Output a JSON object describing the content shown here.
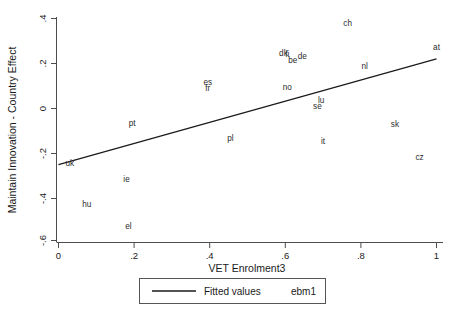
{
  "chart_data": {
    "type": "scatter",
    "title": "",
    "xlabel": "VET Enrolment3",
    "ylabel": "Maintain Innovation - Country Effect",
    "xlim": [
      0,
      1.03
    ],
    "ylim": [
      -0.62,
      0.44
    ],
    "xticks": [
      "0",
      ".2",
      ".4",
      ".6",
      ".8",
      "1"
    ],
    "xtick_values": [
      0,
      0.2,
      0.4,
      0.6,
      0.8,
      1
    ],
    "yticks": [
      ".4",
      ".2",
      "0",
      "-.2",
      "-.4",
      "-.6"
    ],
    "ytick_values": [
      0.4,
      0.2,
      0,
      -0.2,
      -0.4,
      -0.6
    ],
    "grid": false,
    "legend_position": "below-center",
    "marker_style": "text-label-only",
    "points": [
      {
        "label": "uk",
        "x": 0.03,
        "y": -0.25
      },
      {
        "label": "hu",
        "x": 0.075,
        "y": -0.435
      },
      {
        "label": "el",
        "x": 0.185,
        "y": -0.535
      },
      {
        "label": "ie",
        "x": 0.18,
        "y": -0.325
      },
      {
        "label": "pt",
        "x": 0.195,
        "y": -0.07
      },
      {
        "label": "es",
        "x": 0.395,
        "y": 0.115
      },
      {
        "label": "fr",
        "x": 0.395,
        "y": 0.085
      },
      {
        "label": "pl",
        "x": 0.455,
        "y": -0.14
      },
      {
        "label": "dk",
        "x": 0.595,
        "y": 0.245
      },
      {
        "label": "fi",
        "x": 0.605,
        "y": 0.24
      },
      {
        "label": "be",
        "x": 0.62,
        "y": 0.215
      },
      {
        "label": "de",
        "x": 0.645,
        "y": 0.23
      },
      {
        "label": "no",
        "x": 0.605,
        "y": 0.09
      },
      {
        "label": "lu",
        "x": 0.695,
        "y": 0.035
      },
      {
        "label": "se",
        "x": 0.685,
        "y": 0.005
      },
      {
        "label": "it",
        "x": 0.7,
        "y": -0.15
      },
      {
        "label": "ch",
        "x": 0.765,
        "y": 0.38
      },
      {
        "label": "nl",
        "x": 0.81,
        "y": 0.185
      },
      {
        "label": "sk",
        "x": 0.89,
        "y": -0.075
      },
      {
        "label": "cz",
        "x": 0.955,
        "y": -0.225
      },
      {
        "label": "at",
        "x": 1.0,
        "y": 0.27
      }
    ],
    "fitted_line": {
      "name": "Fitted values",
      "x0": 0.0,
      "y0": -0.258,
      "x1": 1.0,
      "y1": 0.218
    },
    "legend": {
      "series_label": "Fitted values",
      "variable_label": "ebm1"
    }
  }
}
